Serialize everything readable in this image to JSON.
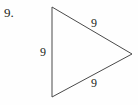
{
  "problem": {
    "number_label": "9."
  },
  "figure": {
    "shape_name": "equilateral-triangle",
    "orientation": "pointing-right",
    "stroke_color": "#4a4a4a",
    "background_color": "#fefefe",
    "text_color": "#231f20",
    "vertices": [
      {
        "name": "top-vertex",
        "x": 52,
        "y": 7
      },
      {
        "name": "right-vertex",
        "x": 132,
        "y": 54
      },
      {
        "name": "bottom-vertex",
        "x": 52,
        "y": 97
      }
    ],
    "sides": [
      {
        "name": "top-side",
        "label": "9"
      },
      {
        "name": "left-side",
        "label": "9"
      },
      {
        "name": "bottom-side",
        "label": "9"
      }
    ]
  }
}
